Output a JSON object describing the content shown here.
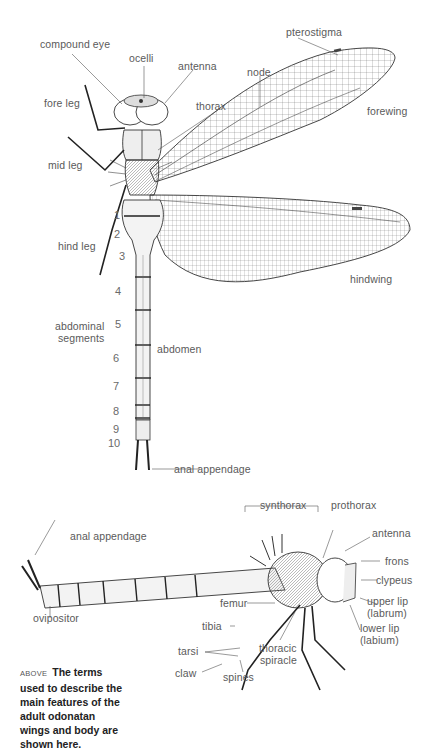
{
  "top_view": {
    "labels": {
      "compound_eye": "compound eye",
      "ocelli": "ocelli",
      "antenna": "antenna",
      "pterostigma": "pterostigma",
      "node": "node",
      "fore_leg": "fore leg",
      "thorax": "thorax",
      "forewing": "forewing",
      "mid_leg": "mid leg",
      "hind_leg": "hind leg",
      "hindwing": "hindwing",
      "abdominal_segments_line1": "abdominal",
      "abdominal_segments_line2": "segments",
      "abdomen": "abdomen",
      "anal_appendage": "anal appendage"
    },
    "segment_numbers": [
      "1",
      "2",
      "3",
      "4",
      "5",
      "6",
      "7",
      "8",
      "9",
      "10"
    ]
  },
  "side_view": {
    "labels": {
      "synthorax": "synthorax",
      "prothorax": "prothorax",
      "anal_appendage": "anal appendage",
      "antenna": "antenna",
      "frons": "frons",
      "clypeus": "clypeus",
      "femur": "femur",
      "upper_lip_line1": "upper lip",
      "upper_lip_line2": "(labrum)",
      "ovipositor": "ovipositor",
      "lower_lip_line1": "lower lip",
      "lower_lip_line2": "(labium)",
      "tibia": "tibia",
      "tarsi": "tarsi",
      "thoracic_spiracle_line1": "thoracic",
      "thoracic_spiracle_line2": "spiracle",
      "claw": "claw",
      "spines": "spines"
    }
  },
  "caption": {
    "kicker": "ABOVE",
    "text": "The terms used to describe the main features of the adult odonatan wings and body are shown here."
  }
}
